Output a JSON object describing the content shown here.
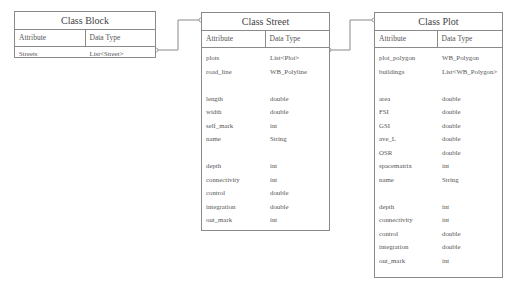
{
  "classes": {
    "block": {
      "title": "Class Block",
      "header": {
        "attribute": "Attribute",
        "type": "Data Type"
      },
      "rows": [
        {
          "attr": "Streets",
          "type": "List<Street>"
        }
      ]
    },
    "street": {
      "title": "Class Street",
      "header": {
        "attribute": "Attribute",
        "type": "Data Type"
      },
      "rows": [
        {
          "attr": "plots",
          "type": "List<Plot>"
        },
        {
          "attr": "road_line",
          "type": "WB_Polyline"
        },
        {
          "attr": "",
          "type": ""
        },
        {
          "attr": "length",
          "type": "double"
        },
        {
          "attr": "width",
          "type": "double"
        },
        {
          "attr": "self_mark",
          "type": "int"
        },
        {
          "attr": "name",
          "type": "String"
        },
        {
          "attr": "",
          "type": ""
        },
        {
          "attr": "depth",
          "type": "int"
        },
        {
          "attr": "connectivity",
          "type": "int"
        },
        {
          "attr": "control",
          "type": "double"
        },
        {
          "attr": "integration",
          "type": "double"
        },
        {
          "attr": "out_mark",
          "type": "int"
        }
      ]
    },
    "plot": {
      "title": "Class Plot",
      "header": {
        "attribute": "Attribute",
        "type": "Data Type"
      },
      "rows": [
        {
          "attr": "plot_polygon",
          "type": "WB_Polygon"
        },
        {
          "attr": "buildings",
          "type": "List<WB_Polygon>"
        },
        {
          "attr": "",
          "type": ""
        },
        {
          "attr": "area",
          "type": "double"
        },
        {
          "attr": "FSI",
          "type": "double"
        },
        {
          "attr": "GSI",
          "type": "double"
        },
        {
          "attr": "ave_L",
          "type": "double"
        },
        {
          "attr": "OSR",
          "type": "double"
        },
        {
          "attr": "spacematrix",
          "type": "int"
        },
        {
          "attr": "name",
          "type": "String"
        },
        {
          "attr": "",
          "type": ""
        },
        {
          "attr": "depth",
          "type": "int"
        },
        {
          "attr": "connectivity",
          "type": "int"
        },
        {
          "attr": "control",
          "type": "double"
        },
        {
          "attr": "integration",
          "type": "double"
        },
        {
          "attr": "out_mark",
          "type": "int"
        }
      ]
    }
  },
  "links": [
    {
      "from": "Class Block.Streets",
      "to": "Class Street"
    },
    {
      "from": "Class Street.plots",
      "to": "Class Plot"
    }
  ]
}
